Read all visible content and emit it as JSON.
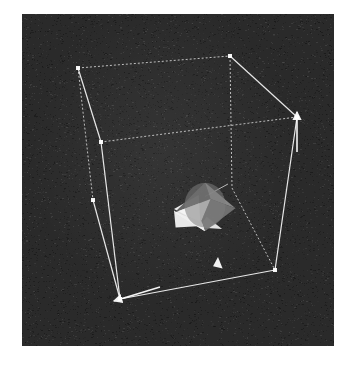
{
  "figure": {
    "kind": "3d-wireframe-bounding-box-render",
    "canvas": {
      "width": 356,
      "height": 369,
      "background": "#ffffff"
    },
    "scene": {
      "x": 22,
      "y": 14,
      "width": 312,
      "height": 332,
      "background": "#2a2a2a",
      "noise_color": "#000000",
      "grain_opacity": 0.55
    },
    "stroke": {
      "solid": "#f2f2f2",
      "dashed": "#e8e8e8",
      "width": 1.2,
      "dash_pattern": "2 2"
    },
    "vertices": {
      "top_back_left": {
        "x": 78,
        "y": 68,
        "visible": true
      },
      "top_back_right": {
        "x": 230,
        "y": 56,
        "visible": true
      },
      "top_front_right": {
        "x": 297,
        "y": 117,
        "visible": true
      },
      "top_front_left": {
        "x": 101,
        "y": 142,
        "visible": true
      },
      "bottom_back_left": {
        "x": 93,
        "y": 200,
        "visible": true
      },
      "bottom_front_left": {
        "x": 120,
        "y": 299,
        "visible": true
      },
      "bottom_front_right": {
        "x": 275,
        "y": 270,
        "visible": true
      },
      "bottom_back_right": {
        "x": 232,
        "y": 188,
        "visible": false
      }
    },
    "edges": [
      {
        "name": "top-back-left--top-back-right",
        "style": "dotted"
      },
      {
        "name": "top-back-right--top-front-right",
        "style": "solid"
      },
      {
        "name": "top-front-right--top-front-left",
        "style": "dotted"
      },
      {
        "name": "top-front-left--top-back-left",
        "style": "solid"
      },
      {
        "name": "top-back-left--bottom-back-left",
        "style": "dotted"
      },
      {
        "name": "top-back-right--bottom-back-right",
        "style": "dotted"
      },
      {
        "name": "top-front-left--bottom-front-left",
        "style": "solid"
      },
      {
        "name": "top-front-right--bottom-front-right",
        "style": "solid"
      },
      {
        "name": "bottom-front-left--bottom-front-right",
        "style": "solid"
      },
      {
        "name": "bottom-back-left--bottom-front-left",
        "style": "solid"
      },
      {
        "name": "bottom-back-right--bottom-front-right",
        "style": "dotted"
      }
    ],
    "axis_arrows": [
      {
        "name": "vertical-axis-arrow",
        "from": {
          "x": 297,
          "y": 152
        },
        "to": {
          "x": 297,
          "y": 112
        },
        "color": "#ffffff"
      },
      {
        "name": "horizontal-axis-arrow",
        "from": {
          "x": 160,
          "y": 287
        },
        "to": {
          "x": 114,
          "y": 301
        },
        "color": "#ffffff"
      }
    ],
    "objects": [
      {
        "name": "central-octahedron",
        "center": {
          "x": 205,
          "y": 212
        },
        "radius_px": 31,
        "faces": [
          {
            "name": "face-left-bright",
            "fill": "#f4f4f4"
          },
          {
            "name": "face-bottom-bright",
            "fill": "#efefef"
          },
          {
            "name": "face-top-grey",
            "fill": "#8e8e8e"
          },
          {
            "name": "face-right-grey",
            "fill": "#767676"
          },
          {
            "name": "face-upper-dark",
            "fill": "#5a5a5a"
          }
        ],
        "tether_line": {
          "to": {
            "x": 228,
            "y": 184
          },
          "color": "#dcdcdc"
        }
      },
      {
        "name": "small-fragment",
        "center": {
          "x": 218,
          "y": 263
        },
        "size_px": 11,
        "fill": "#fafafa"
      }
    ]
  }
}
